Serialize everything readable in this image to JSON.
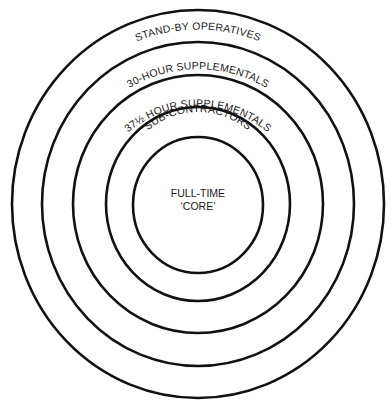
{
  "diagram": {
    "type": "concentric-circles",
    "rings": [
      {
        "label": "STAND-BY OPERATIVES",
        "level": 1
      },
      {
        "label": "30-HOUR SUPPLEMENTALS",
        "level": 2
      },
      {
        "label": "37½ HOUR SUPPLEMENTALS",
        "level": 3
      },
      {
        "label": "SUB-CONTRACTORS",
        "level": 4
      }
    ],
    "core": {
      "line1": "FULL-TIME",
      "line2": "‘CORE’"
    },
    "stroke_color": "#111111",
    "background": "#ffffff"
  }
}
